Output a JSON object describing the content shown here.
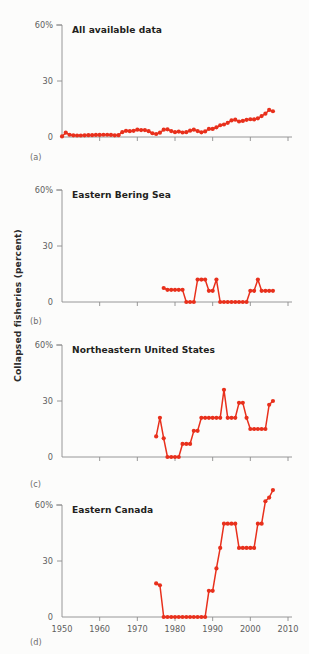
{
  "figure": {
    "y_axis_label": "Collapsed fisheries (percent)",
    "accent_color": "#e8301c",
    "axis_color": "#8d8d8d",
    "text_color": "#231f20",
    "background": "#fcfcfb"
  },
  "panels": [
    {
      "letter": "(a)",
      "title": "All available data"
    },
    {
      "letter": "(b)",
      "title": "Eastern Bering Sea"
    },
    {
      "letter": "(c)",
      "title": "Northeastern United States"
    },
    {
      "letter": "(d)",
      "title": "Eastern Canada"
    }
  ],
  "chart_data": [
    {
      "type": "line",
      "title": "All available data",
      "panel": "(a)",
      "xlabel": "",
      "ylabel": "Collapsed fisheries (percent)",
      "xlim": [
        1950,
        2010
      ],
      "ylim": [
        0,
        60
      ],
      "xticks": [
        1950,
        1960,
        1970,
        1980,
        1990,
        2000,
        2010
      ],
      "xticklabels": [
        "1950",
        "1960",
        "1970",
        "1980",
        "1990",
        "2000",
        "2010"
      ],
      "yticks": [
        0,
        30,
        60
      ],
      "yticklabels": [
        "0",
        "30",
        "60%"
      ],
      "grid": false,
      "legend": null,
      "markers": "circle",
      "x": [
        1950,
        1951,
        1952,
        1953,
        1954,
        1955,
        1956,
        1957,
        1958,
        1959,
        1960,
        1961,
        1962,
        1963,
        1964,
        1965,
        1966,
        1967,
        1968,
        1969,
        1970,
        1971,
        1972,
        1973,
        1974,
        1975,
        1976,
        1977,
        1978,
        1979,
        1980,
        1981,
        1982,
        1983,
        1984,
        1985,
        1986,
        1987,
        1988,
        1989,
        1990,
        1991,
        1992,
        1993,
        1994,
        1995,
        1996,
        1997,
        1998,
        1999,
        2000,
        2001,
        2002,
        2003,
        2004,
        2005,
        2006
      ],
      "values": [
        0.3,
        2.3,
        1.2,
        0.9,
        0.8,
        0.8,
        0.9,
        1.0,
        1.0,
        1.1,
        1.1,
        1.2,
        1.2,
        1.1,
        0.9,
        1.0,
        2.6,
        3.3,
        3.1,
        3.3,
        3.9,
        3.7,
        3.7,
        3.1,
        2.0,
        1.6,
        2.3,
        3.9,
        4.1,
        3.2,
        2.6,
        2.9,
        2.4,
        2.6,
        3.4,
        3.9,
        3.2,
        2.5,
        3.0,
        4.3,
        4.3,
        5.2,
        6.3,
        6.7,
        7.6,
        8.9,
        9.3,
        8.3,
        8.6,
        9.2,
        9.5,
        9.4,
        10.0,
        11.2,
        12.5,
        14.5,
        13.8
      ]
    },
    {
      "type": "line",
      "title": "Eastern Bering Sea",
      "panel": "(b)",
      "xlabel": "",
      "ylabel": "Collapsed fisheries (percent)",
      "xlim": [
        1950,
        2010
      ],
      "ylim": [
        0,
        60
      ],
      "xticks": [
        1950,
        1960,
        1970,
        1980,
        1990,
        2000,
        2010
      ],
      "xticklabels": [
        "1950",
        "1960",
        "1970",
        "1980",
        "1990",
        "2000",
        "2010"
      ],
      "yticks": [
        0,
        30,
        60
      ],
      "yticklabels": [
        "0",
        "30",
        "60%"
      ],
      "grid": false,
      "legend": null,
      "markers": "circle",
      "x": [
        1977,
        1978,
        1979,
        1980,
        1981,
        1982,
        1983,
        1984,
        1985,
        1986,
        1987,
        1988,
        1989,
        1990,
        1991,
        1992,
        1993,
        1994,
        1995,
        1996,
        1997,
        1998,
        1999,
        2000,
        2001,
        2002,
        2003,
        2004,
        2005,
        2006
      ],
      "values": [
        7.5,
        6.5,
        6.5,
        6.5,
        6.5,
        6.5,
        0,
        0,
        0,
        12,
        12,
        12,
        6,
        6,
        12,
        0,
        0,
        0,
        0,
        0,
        0,
        0,
        0,
        6,
        6,
        12,
        6,
        6,
        6,
        6
      ]
    },
    {
      "type": "line",
      "title": "Northeastern United States",
      "panel": "(c)",
      "xlabel": "",
      "ylabel": "Collapsed fisheries (percent)",
      "xlim": [
        1950,
        2010
      ],
      "ylim": [
        0,
        60
      ],
      "xticks": [
        1950,
        1960,
        1970,
        1980,
        1990,
        2000,
        2010
      ],
      "xticklabels": [
        "1950",
        "1960",
        "1970",
        "1980",
        "1990",
        "2000",
        "2010"
      ],
      "yticks": [
        0,
        30,
        60
      ],
      "yticklabels": [
        "0",
        "30",
        "60%"
      ],
      "grid": false,
      "legend": null,
      "markers": "circle",
      "x": [
        1975,
        1976,
        1977,
        1978,
        1979,
        1980,
        1981,
        1982,
        1983,
        1984,
        1985,
        1986,
        1987,
        1988,
        1989,
        1990,
        1991,
        1992,
        1993,
        1994,
        1995,
        1996,
        1997,
        1998,
        1999,
        2000,
        2001,
        2002,
        2003,
        2004,
        2005,
        2006
      ],
      "values": [
        11,
        21,
        10,
        0,
        0,
        0,
        0,
        7,
        7,
        7,
        14,
        14,
        21,
        21,
        21,
        21,
        21,
        21,
        36,
        21,
        21,
        21,
        29,
        29,
        21,
        15,
        15,
        15,
        15,
        15,
        28,
        30
      ]
    },
    {
      "type": "line",
      "title": "Eastern Canada",
      "panel": "(d)",
      "xlabel": "",
      "ylabel": "Collapsed fisheries (percent)",
      "xlim": [
        1950,
        2010
      ],
      "ylim": [
        0,
        60
      ],
      "xticks": [
        1950,
        1960,
        1970,
        1980,
        1990,
        2000,
        2010
      ],
      "xticklabels": [
        "1950",
        "1960",
        "1970",
        "1980",
        "1990",
        "2000",
        "2010"
      ],
      "yticks": [
        0,
        30,
        60
      ],
      "yticklabels": [
        "0",
        "30",
        "60%"
      ],
      "grid": false,
      "legend": null,
      "markers": "circle",
      "x": [
        1975,
        1976,
        1977,
        1978,
        1979,
        1980,
        1981,
        1982,
        1983,
        1984,
        1985,
        1986,
        1987,
        1988,
        1989,
        1990,
        1991,
        1992,
        1993,
        1994,
        1995,
        1996,
        1997,
        1998,
        1999,
        2000,
        2001,
        2002,
        2003,
        2004,
        2005,
        2006
      ],
      "values": [
        18,
        17,
        0,
        0,
        0,
        0,
        0,
        0,
        0,
        0,
        0,
        0,
        0,
        0,
        14,
        14,
        26,
        37,
        50,
        50,
        50,
        50,
        37,
        37,
        37,
        37,
        37,
        50,
        50,
        62,
        64,
        68
      ]
    }
  ]
}
